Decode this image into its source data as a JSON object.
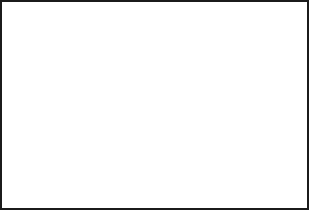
{
  "figure": {
    "kind": "anatomical-illustration",
    "width": 309,
    "height": 210,
    "background_color": "#ffffff",
    "border_color": "#1b1b1b",
    "text_color": "#171717",
    "ink_color": "#000000"
  },
  "illustration": {
    "name": "lumbar spine lateral view",
    "line_color": "#2b2b2b",
    "bone_fill": "#dcdcdc",
    "shadow_fill": "#8e8e8e",
    "dark_fill": "#5a5a5a"
  },
  "callouts": [
    {
      "id": "nerve-roots",
      "underlined_term": "Nerve roots",
      "rest": " exit the spine at each joint level or motion unit.",
      "full_text": "Nerve roots exit the spine at each joint level or motion unit.",
      "arrow": {
        "tail_x": 160,
        "tail_y": 24,
        "tip_x": 62,
        "tip_y": 47,
        "color": "#000000"
      }
    },
    {
      "id": "bulging-disc",
      "underlined_term": "A bulging disc",
      "rest": " or an arthritic facet joint are both candidates for causing local pain or pain anywhere along the length that the nerve travels.",
      "full_text": "A bulging disc or an arthritic facet joint are both candidates for causing local pain or pain anywhere along the length that the nerve travels.",
      "arrow": {
        "tail_x": 158,
        "tail_y": 71,
        "tip_x": 89,
        "tip_y": 115,
        "color": "#000000"
      }
    }
  ]
}
